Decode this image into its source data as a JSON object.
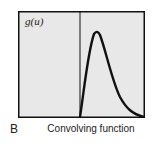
{
  "panel": {
    "letter": "B",
    "caption": "Convolving function",
    "ylabel": "g(u)"
  },
  "colors": {
    "plot_background": "#e8e8e8",
    "frame": "#111111",
    "curve": "#111111"
  },
  "curve": {
    "description": "Asymmetric pulse: zero for u<0, rises sharply after the origin to a peak, then decays slowly toward zero",
    "origin_fraction_x": 0.49,
    "peak_fraction_x": 0.6,
    "peak_fraction_y": 0.2
  }
}
